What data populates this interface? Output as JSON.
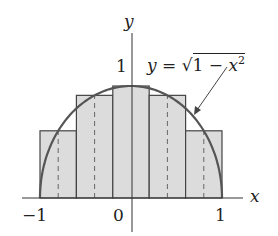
{
  "diagram": {
    "axes": {
      "x_label": "x",
      "y_label": "y"
    },
    "ticks": {
      "x_left": "−1",
      "x_origin": "0",
      "x_right": "1",
      "y_one": "1"
    },
    "curve_label": {
      "lhs": "y",
      "eq": "=",
      "rad": "1 − ",
      "var": "x",
      "exp": "2"
    },
    "rectangles": [
      {
        "x0": -1.0,
        "x1": -0.6,
        "mid": -0.8,
        "height": 0.6
      },
      {
        "x0": -0.6,
        "x1": -0.2,
        "mid": -0.4,
        "height": 0.9165
      },
      {
        "x0": -0.2,
        "x1": 0.2,
        "mid": 0.0,
        "height": 1.0
      },
      {
        "x0": 0.2,
        "x1": 0.6,
        "mid": 0.4,
        "height": 0.9165
      },
      {
        "x0": 0.6,
        "x1": 1.0,
        "mid": 0.8,
        "height": 0.6
      }
    ],
    "colors": {
      "fill": "#dcdcdc",
      "stroke": "#444444",
      "curve": "#555555"
    }
  }
}
